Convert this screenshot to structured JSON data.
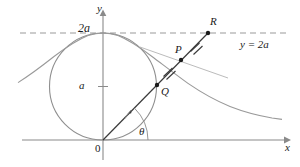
{
  "figure": {
    "title_alt": "Witch of Agnesi construction diagram",
    "colors": {
      "axis": "#8a8a8a",
      "curve": "#9a9a9a",
      "circle": "#8f8f8f",
      "ray": "#3a3a3a",
      "dashed": "#9a9a9a",
      "point": "#1a1a1a",
      "text": "#1a1a1a"
    },
    "labels": {
      "y_axis": "y",
      "x_axis": "x",
      "origin": "0",
      "two_a": "2a",
      "a": "a",
      "point_P": "P",
      "point_Q": "Q",
      "point_R": "R",
      "angle": "θ",
      "asymptote_equation": "y = 2a"
    },
    "geometry": {
      "origin": [
        103,
        140
      ],
      "circle_center": [
        103,
        86.5
      ],
      "circle_radius": 53.5,
      "asymptote_y": 33,
      "asymptote_x_start": 20,
      "asymptote_x_end": 290,
      "x_axis_y": 140,
      "x_axis_start": 22,
      "x_axis_end": 288,
      "y_axis_x": 103,
      "y_axis_top": 12,
      "y_axis_bottom": 160,
      "point_Q": [
        157,
        85
      ],
      "point_P": [
        181,
        60
      ],
      "point_R": [
        208,
        33
      ],
      "a_tick_y": 86.5,
      "curve_peak": [
        103,
        33
      ],
      "tick_marks_on": [
        "QP",
        "PR"
      ]
    }
  }
}
